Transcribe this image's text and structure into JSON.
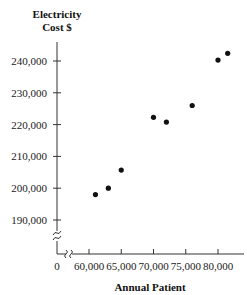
{
  "chart_data": {
    "type": "scatter",
    "title": "",
    "ylabel": "Electricity Cost $",
    "ylabel_lines": [
      "Electricity",
      "Cost $"
    ],
    "xlabel": "Annual Patient",
    "x_ticks": [
      60000,
      65000,
      70000,
      75000,
      80000
    ],
    "x_tick_labels": [
      "60,000",
      "65,000",
      "70,000",
      "75,000",
      "80,000"
    ],
    "y_ticks": [
      190000,
      200000,
      210000,
      220000,
      230000,
      240000
    ],
    "y_tick_labels": [
      "190,000",
      "200,000",
      "210,000",
      "220,000",
      "230,000",
      "240,000"
    ],
    "origin_label": "0",
    "axis_breaks": {
      "x": true,
      "y": true
    },
    "xlim": [
      60000,
      82000
    ],
    "ylim": [
      190000,
      243000
    ],
    "grid": false,
    "legend": null,
    "points": [
      {
        "x": 61000,
        "y": 198000
      },
      {
        "x": 63000,
        "y": 200000
      },
      {
        "x": 65000,
        "y": 205700
      },
      {
        "x": 70000,
        "y": 222300
      },
      {
        "x": 72000,
        "y": 220800
      },
      {
        "x": 76000,
        "y": 226000
      },
      {
        "x": 80000,
        "y": 240300
      },
      {
        "x": 81500,
        "y": 242400
      }
    ],
    "marker_color": "#111111"
  }
}
